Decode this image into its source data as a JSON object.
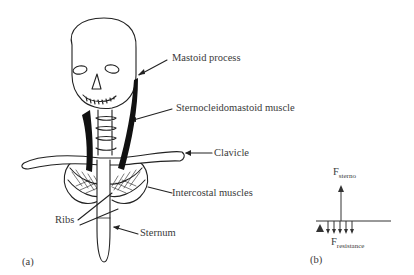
{
  "panel_a": {
    "tag": "(a)",
    "labels": {
      "mastoid": "Mastoid process",
      "scm": "Sternocleidomastoid muscle",
      "clavicle": "Clavicle",
      "intercostal": "Intercostal muscles",
      "ribs": "Ribs",
      "sternum": "Sternum"
    }
  },
  "panel_b": {
    "tag": "(b)",
    "f_sterno": {
      "main": "F",
      "sub": "sterno"
    },
    "f_resistance": {
      "main": "F",
      "sub": "resistance"
    }
  },
  "colors": {
    "line": "#222222",
    "muscle": "#111111",
    "text": "#3a3a3a"
  }
}
